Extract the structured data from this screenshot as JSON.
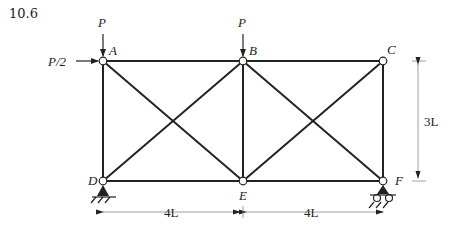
{
  "problem_number": "10.6",
  "nodes": {
    "A": {
      "label": "A"
    },
    "B": {
      "label": "B"
    },
    "C": {
      "label": "C"
    },
    "D": {
      "label": "D"
    },
    "E": {
      "label": "E"
    },
    "F": {
      "label": "F"
    }
  },
  "loads": {
    "load_A_vertical": "P",
    "load_B_vertical": "P",
    "load_A_horizontal": "P/2"
  },
  "dimensions": {
    "span_DE": "4L",
    "span_EF": "4L",
    "height": "3L"
  },
  "supports": {
    "D": "pin",
    "F": "roller"
  },
  "colors": {
    "member": "#222222",
    "dimension_line": "#888888"
  }
}
